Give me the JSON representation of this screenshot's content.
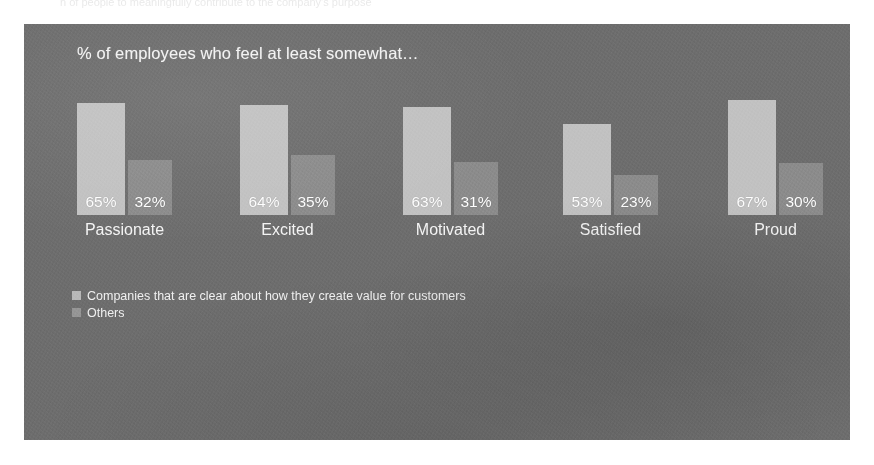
{
  "page": {
    "faint_top_text": "n of people to meaningfully contribute to the company's purpose"
  },
  "chart_data": {
    "type": "bar",
    "title": "% of employees who feel at least somewhat…",
    "xlabel": "",
    "ylabel": "",
    "ylim": [
      0,
      70
    ],
    "grid": false,
    "legend_position": "bottom-left",
    "categories": [
      "Passionate",
      "Excited",
      "Motivated",
      "Satisfied",
      "Proud"
    ],
    "series": [
      {
        "name": "Companies that are clear about how they create value for customers",
        "color": "#c2c2c2",
        "values": [
          65,
          64,
          63,
          53,
          67
        ],
        "labels": [
          "65%",
          "64%",
          "63%",
          "53%",
          "67%"
        ]
      },
      {
        "name": "Others",
        "color": "#8c8c8c",
        "values": [
          32,
          35,
          31,
          23,
          30
        ],
        "labels": [
          "32%",
          "35%",
          "31%",
          "23%",
          "30%"
        ]
      }
    ]
  },
  "style": {
    "panel_background": "#6e6e6e",
    "text_color": "#f2f2f2",
    "series1_color": "#c2c2c2",
    "series2_color": "#8c8c8c"
  }
}
